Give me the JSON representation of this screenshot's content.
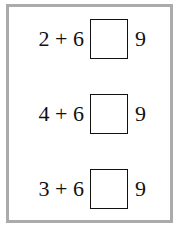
{
  "worksheet": {
    "rows": [
      {
        "left": "2 + 6",
        "answer": "",
        "right": "9"
      },
      {
        "left": "4 + 6",
        "answer": "",
        "right": "9"
      },
      {
        "left": "3 + 6",
        "answer": "",
        "right": "9"
      }
    ]
  }
}
